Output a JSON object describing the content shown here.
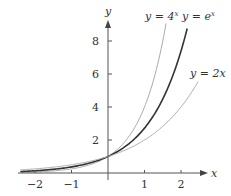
{
  "chart_data": {
    "type": "line",
    "title": "",
    "xlabel": "x",
    "ylabel": "y",
    "xlim": [
      -2.4,
      2.7
    ],
    "ylim": [
      0,
      9.2
    ],
    "grid": false,
    "legend_position": "inline labels near curve ends",
    "x_ticks": [
      -2,
      -1,
      1,
      2
    ],
    "x_tick_labels": [
      "−2",
      "−1",
      "1",
      "2"
    ],
    "y_ticks": [
      2,
      4,
      6,
      8
    ],
    "y_tick_labels": [
      "2",
      "4",
      "6",
      "8"
    ],
    "series": [
      {
        "name": "y = 4^x",
        "label_base": "y = 4",
        "label_sup": "x",
        "base": 4,
        "x_range": [
          -2.4,
          1.59
        ],
        "color": "#aaaaaa",
        "stroke_width": 1,
        "sample_points": [
          [
            -2,
            0.0625
          ],
          [
            -1,
            0.25
          ],
          [
            0,
            1
          ],
          [
            0.5,
            2
          ],
          [
            1,
            4
          ],
          [
            1.5,
            8
          ],
          [
            1.59,
            9.06
          ]
        ]
      },
      {
        "name": "y = e^x",
        "label_base": "y = e",
        "label_sup": "x",
        "base": 2.718281828,
        "x_range": [
          -2.4,
          2.17
        ],
        "color": "#333333",
        "stroke_width": 1.6,
        "sample_points": [
          [
            -2,
            0.135
          ],
          [
            -1,
            0.368
          ],
          [
            0,
            1
          ],
          [
            1,
            2.718
          ],
          [
            2,
            7.389
          ],
          [
            2.17,
            8.76
          ]
        ]
      },
      {
        "name": "y = 2x",
        "label_base": "y = 2x",
        "label_sup": "",
        "base": 2,
        "x_range": [
          -2.4,
          2.47
        ],
        "color": "#b0b0b0",
        "stroke_width": 1,
        "sample_points": [
          [
            -2,
            0.25
          ],
          [
            -1,
            0.5
          ],
          [
            0,
            1
          ],
          [
            1,
            2
          ],
          [
            2,
            4
          ],
          [
            2.47,
            5.54
          ]
        ]
      }
    ]
  },
  "axes": {
    "x_label": "x",
    "y_label": "y",
    "color": "#555555"
  }
}
